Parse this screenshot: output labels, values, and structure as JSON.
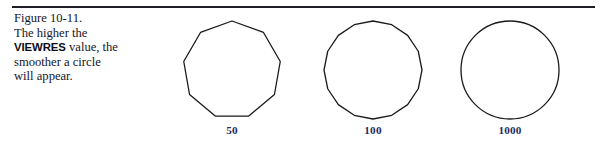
{
  "figure": {
    "number_label": "Figure 10-11.",
    "caption_lines": [
      "The higher the",
      "VIEWRES value, the",
      "smoother a circle",
      "will appear."
    ],
    "caption_keyword": "VIEWRES",
    "caption_before_keyword": "The higher the",
    "caption_after_keyword_1": " value, the",
    "caption_after_keyword_2": "smoother a circle",
    "caption_after_keyword_3": "will appear."
  },
  "colors": {
    "rule": "#1d1d24",
    "caption_text": "#16162a",
    "figure_number": "#1b1b3a",
    "label": "#2a2a5e",
    "stroke": "#1a1a1a",
    "background": "#ffffff"
  },
  "chart_data": {
    "type": "diagram",
    "title": "Figure 10-11.",
    "description": "The higher the VIEWRES value, the smoother a circle will appear.",
    "shapes": [
      {
        "label": "50",
        "viewres": 50,
        "sides": 9,
        "rendered_as": "polygon",
        "radius_px": 49,
        "center_x_px": 232,
        "center_y_px": 72
      },
      {
        "label": "100",
        "viewres": 100,
        "sides": 16,
        "rendered_as": "polygon",
        "radius_px": 49,
        "center_x_px": 373,
        "center_y_px": 72
      },
      {
        "label": "1000",
        "viewres": 1000,
        "sides": 0,
        "rendered_as": "circle",
        "radius_px": 49,
        "center_x_px": 510,
        "center_y_px": 72
      }
    ],
    "xlabel": "",
    "ylabel": "",
    "legend": []
  }
}
